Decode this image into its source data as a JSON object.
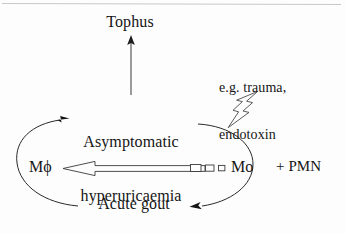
{
  "figure": {
    "background_color": "#fdfdfd",
    "ink_color": "#151515",
    "nodes": {
      "tophus": "Tophus",
      "asymptomatic_line1": "Asymptomatic",
      "asymptomatic_line2": "hyperuricaemia",
      "macrophage": "Mϕ",
      "monocyte": "Mo",
      "pmn": "+ PMN",
      "acute_gout": "Acute gout",
      "stimulus_line1": "e.g. trauma,",
      "stimulus_line2": "endotoxin"
    },
    "connectors": {
      "tophus_arrow": "vertical arrow from hyperuricaemia up to Tophus",
      "left_cycle_arrow": "curve from Acute gout around left up to Asymptomatic hyperuricaemia",
      "right_cycle_arrow": "curve from hyperuricaemia around right down to Acute gout",
      "differentiation_arrow": "hollow arrow from Mo left to Mϕ",
      "dissolving_tail": "three shrinking hollow rectangles trailing the arrow shaft",
      "lightning_arrow": "hollow lightning bolt arrow pointing down-left at the cycle"
    }
  }
}
